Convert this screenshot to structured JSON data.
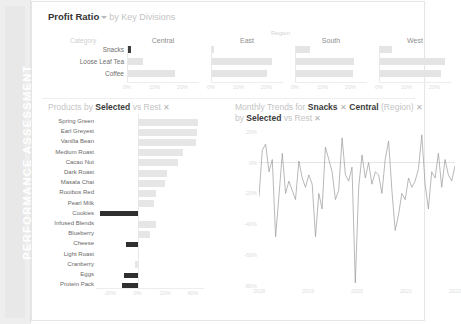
{
  "sidebar": {
    "label": "PERFORMANCE ASSESSMENT"
  },
  "header": {
    "measure": "Profit Ratio",
    "caret_icon": "chevron-down-icon",
    "by_text": "by Key Divisions"
  },
  "top_panel": {
    "region_caption": "Region",
    "category_caption": "Category",
    "categories": [
      "Snacks",
      "Loose Leaf Tea",
      "Coffee"
    ],
    "regions": [
      "Central",
      "East",
      "South",
      "West"
    ],
    "tick_labels": [
      "0%",
      "10%",
      "20%"
    ],
    "axis_max": 26,
    "series": [
      {
        "region": "Central",
        "values": [
          1.2,
          5.5,
          17.0
        ],
        "selected": [
          true,
          false,
          false
        ]
      },
      {
        "region": "East",
        "values": [
          0.6,
          21.5,
          20.0
        ],
        "selected": [
          false,
          false,
          false
        ]
      },
      {
        "region": "South",
        "values": [
          5.0,
          21.0,
          20.5
        ],
        "selected": [
          false,
          false,
          false
        ]
      },
      {
        "region": "West",
        "values": [
          4.5,
          23.5,
          22.0
        ],
        "selected": [
          false,
          false,
          false
        ]
      }
    ]
  },
  "products_panel": {
    "title_prefix": "Products",
    "title_by": "by",
    "title_selected": "Selected",
    "title_vs": "vs Rest",
    "close_icon": "close-icon",
    "tick_labels": [
      "-20%",
      "0%",
      "20%",
      "40%"
    ],
    "x_min": -30,
    "x_max": 48,
    "chart_data": {
      "type": "bar",
      "title": "Products by Selected vs Rest",
      "xlabel": "",
      "ylabel": "",
      "xlim": [
        -30,
        48
      ],
      "grid": false,
      "categories": [
        "Spring Green",
        "Earl Greyest",
        "Vanilla Bean",
        "Medium Roast",
        "Cacao Nut",
        "Dark Roast",
        "Masala Chai",
        "Rooibos Red",
        "Pearl Milk",
        "Cookies",
        "Infused Blends",
        "Blueberry",
        "Cheese",
        "Light Roast",
        "Cranberry",
        "Eggs",
        "Protein Pack"
      ],
      "values": [
        44,
        43,
        42,
        33,
        29,
        21,
        20,
        13,
        12,
        -27,
        13,
        9,
        -8,
        1,
        -2,
        -10,
        -11
      ],
      "selected_flags": [
        false,
        false,
        false,
        false,
        false,
        false,
        false,
        false,
        false,
        true,
        false,
        false,
        true,
        false,
        false,
        true,
        true
      ]
    }
  },
  "trends_panel": {
    "title_prefix": "Monthly Trends",
    "title_for": "for",
    "tag_snacks": "Snacks",
    "tag_central": "Central",
    "tag_region": "(Region)",
    "title_by": "by",
    "title_selected": "Selected",
    "title_vs": "vs Rest",
    "close_icon": "close-icon",
    "chart_data": {
      "type": "line",
      "title": "Monthly Trends for Snacks / Central by Selected vs Rest",
      "xlabel": "",
      "ylabel": "",
      "ylim": [
        -80,
        25
      ],
      "y_ticks": [
        "20%",
        "0%",
        "-20%",
        "-40%",
        "-60%",
        "-80%"
      ],
      "y_tick_values": [
        20,
        0,
        -20,
        -40,
        -60,
        -80
      ],
      "x_ticks": [
        "2018",
        "2019",
        "2020",
        "2021",
        "2022"
      ],
      "zero_line": 0,
      "series": [
        {
          "name": "Selected",
          "values": [
            -22,
            8,
            12,
            -6,
            2,
            -48,
            -22,
            6,
            -20,
            -12,
            -18,
            -24,
            1,
            -10,
            -16,
            -8,
            -14,
            -48,
            -20,
            -30,
            10,
            2,
            -6,
            -24,
            -18,
            16,
            -8,
            -12,
            -3,
            -78,
            -16,
            5,
            -10,
            0,
            -14,
            -6,
            -8,
            -20,
            2,
            14,
            -18,
            -44,
            -34,
            -20,
            -24,
            -10,
            -16,
            -12,
            -4,
            18,
            -14,
            -30,
            -6,
            -10,
            6,
            -16,
            2,
            -8,
            -12,
            -2
          ]
        }
      ]
    }
  },
  "colors": {
    "selected_bar": "#2f2f2f",
    "rest_bar": "#e6e6e6",
    "line": "#9a9a9a",
    "sidebar_band": "#eeeeee",
    "card_bg": "#ffffff"
  }
}
